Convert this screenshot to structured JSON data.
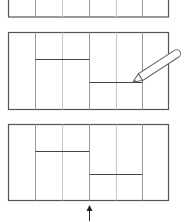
{
  "diagram": {
    "colors": {
      "outline": "#555555",
      "inner_line": "#9a9a9a",
      "pencil_outline": "#666666",
      "pencil_fill": "#ffffff",
      "arrow": "#222222"
    },
    "panels": [
      {
        "id": "panel-1",
        "step": 1,
        "has_horizontals": false
      },
      {
        "id": "panel-2",
        "step": 2,
        "has_horizontals": true,
        "has_pencil": true
      },
      {
        "id": "panel-3",
        "step": 3,
        "has_horizontals": true,
        "has_arrow": true
      }
    ],
    "columns": 6
  }
}
